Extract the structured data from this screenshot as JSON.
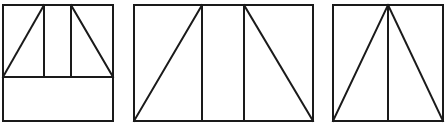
{
  "diagram": {
    "stroke_color": "#1a1a1a",
    "background": "#ffffff",
    "figures": [
      {
        "name": "figure-1",
        "rect": {
          "x": 3,
          "y": 5,
          "w": 110,
          "h": 116
        },
        "lines": [
          [
            3,
            77,
            113,
            77
          ],
          [
            44,
            5,
            44,
            77
          ],
          [
            71,
            5,
            71,
            77
          ],
          [
            3,
            77,
            44,
            5
          ],
          [
            71,
            5,
            113,
            77
          ]
        ]
      },
      {
        "name": "figure-2",
        "rect": {
          "x": 134,
          "y": 5,
          "w": 179,
          "h": 116
        },
        "lines": [
          [
            202,
            5,
            202,
            121
          ],
          [
            244,
            5,
            244,
            121
          ],
          [
            134,
            121,
            202,
            5
          ],
          [
            244,
            5,
            313,
            121
          ]
        ]
      },
      {
        "name": "figure-3",
        "rect": {
          "x": 333,
          "y": 5,
          "w": 110,
          "h": 116
        },
        "lines": [
          [
            388,
            5,
            388,
            121
          ],
          [
            333,
            121,
            388,
            5
          ],
          [
            388,
            5,
            443,
            121
          ]
        ]
      }
    ]
  }
}
